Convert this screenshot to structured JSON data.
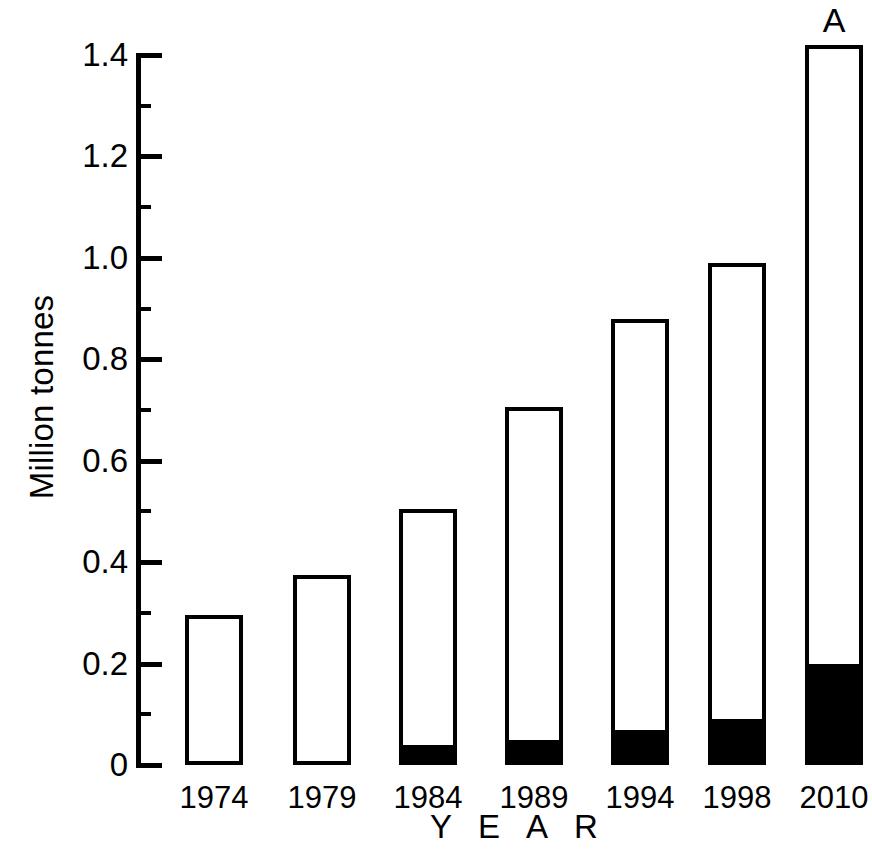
{
  "chart_data": {
    "type": "bar",
    "title": "",
    "subtitle": "",
    "xlabel": "YEAR",
    "ylabel": "Million tonnes",
    "categories": [
      "1974",
      "1979",
      "1984",
      "1989",
      "1994",
      "1998",
      "2010"
    ],
    "series": [
      {
        "name": "total",
        "values": [
          0.295,
          0.375,
          0.505,
          0.705,
          0.88,
          0.99,
          1.42
        ]
      },
      {
        "name": "filled-lower-segment",
        "values": [
          0.0,
          0.0,
          0.04,
          0.05,
          0.07,
          0.09,
          0.2
        ]
      }
    ],
    "ylim": [
      0,
      1.4
    ],
    "xlim_note": "categorical",
    "ytick_labels": [
      "0",
      "0.2",
      "0.4",
      "0.6",
      "0.8",
      "1.0",
      "1.2",
      "1.4"
    ],
    "ytick_values": [
      0,
      0.2,
      0.4,
      0.6,
      0.8,
      1.0,
      1.2,
      1.4
    ],
    "yminor_values": [
      0.1,
      0.3,
      0.5,
      0.7,
      0.9,
      1.1,
      1.3
    ],
    "grid": false,
    "legend": "none",
    "annotations": [
      {
        "text": "A",
        "target_category": "2010",
        "position": "above-bar"
      }
    ],
    "bar_style": {
      "outline_color": "#000000",
      "fill_color": "#ffffff",
      "segment_fill_color": "#000000"
    }
  },
  "geometry": {
    "baseline_y": 765,
    "top_y": 55,
    "px_per_unit": 507.1,
    "axis_x": 136,
    "bars": [
      {
        "x": 185,
        "width": 58
      },
      {
        "x": 293,
        "width": 58
      },
      {
        "x": 399,
        "width": 58
      },
      {
        "x": 505,
        "width": 58
      },
      {
        "x": 611,
        "width": 58
      },
      {
        "x": 708,
        "width": 58
      },
      {
        "x": 805,
        "width": 58
      }
    ]
  }
}
